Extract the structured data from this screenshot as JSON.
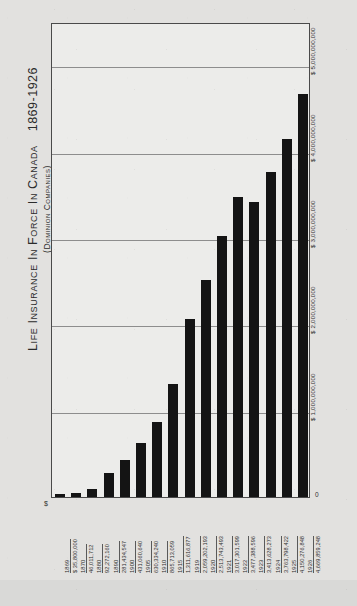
{
  "title": {
    "main": "Life Insurance In Force In Canada",
    "years": "1869-1926",
    "subtitle": "(Dominion Companies)"
  },
  "axis": {
    "y_zero_label": "0",
    "dollar_mark": "$",
    "y_ticks": [
      "$ 1,000,000,000",
      "$ 2,000,000,000",
      "$ 3,000,000,000",
      "$ 4,000,000,000",
      "$ 5,000,000,000"
    ]
  },
  "chart_data": {
    "type": "bar",
    "subtitle": "(Dominion Companies)",
    "xlabel": "",
    "ylabel": "",
    "ylim": [
      0,
      5500000000
    ],
    "grid": true,
    "legend": false,
    "categories": [
      "1869",
      "1870",
      "1880",
      "1890",
      "1900",
      "1905",
      "1910",
      "1915",
      "1919",
      "1920",
      "1921",
      "1922",
      "1923",
      "1924",
      "1925",
      "1926"
    ],
    "values": [
      35800000,
      46011712,
      92272160,
      281434547,
      431060640,
      630334240,
      865713059,
      1311616877,
      2059202193,
      2513743493,
      3017301599,
      3477388596,
      3413628273,
      3763798422,
      4150276848,
      4669859248
    ],
    "value_labels": [
      "$ 35,800,000",
      "46,011,712",
      "92,272,160",
      "281,434,547",
      "431,060,640",
      "630,334,240",
      "865,713,059",
      "1,311,616,877",
      "2,059,202,193",
      "2,513,743,493",
      "3,017,301,599",
      "3,477,388,596",
      "3,413,628,273",
      "3,763,798,422",
      "4,150,276,848",
      "4,669,859,248"
    ],
    "bars": [
      {
        "year": "1869",
        "amount": "$ 35,800,000",
        "value": 35800000
      },
      {
        "year": "1870",
        "amount": "46,011,712",
        "value": 46011712
      },
      {
        "year": "1880",
        "amount": "92,272,160",
        "value": 92272160
      },
      {
        "year": "1890",
        "amount": "281,434,547",
        "value": 281434547
      },
      {
        "year": "1900",
        "amount": "431,060,640",
        "value": 431060640
      },
      {
        "year": "1905",
        "amount": "630,334,240",
        "value": 630334240
      },
      {
        "year": "1910",
        "amount": "865,713,059",
        "value": 865713059
      },
      {
        "year": "1915",
        "amount": "1,311,616,877",
        "value": 1311616877
      },
      {
        "year": "1919",
        "amount": "2,059,202,193",
        "value": 2059202193
      },
      {
        "year": "1920",
        "amount": "2,513,743,493",
        "value": 2513743493
      },
      {
        "year": "1921",
        "amount": "3,017,301,599",
        "value": 3017301599
      },
      {
        "year": "1922",
        "amount": "3,477,388,596",
        "value": 3477388596
      },
      {
        "year": "1923",
        "amount": "3,413,628,273",
        "value": 3413628273
      },
      {
        "year": "1924",
        "amount": "3,763,798,422",
        "value": 3763798422
      },
      {
        "year": "1925",
        "amount": "4,150,276,848",
        "value": 4150276848
      },
      {
        "year": "1926",
        "amount": "4,669,859,248",
        "value": 4669859248
      }
    ],
    "colors": {
      "bar": "#141414",
      "grid": "#8d8d8d",
      "frame": "#4a4a4a",
      "plot_background": "#ececea",
      "paper": "#e2e1df"
    }
  }
}
